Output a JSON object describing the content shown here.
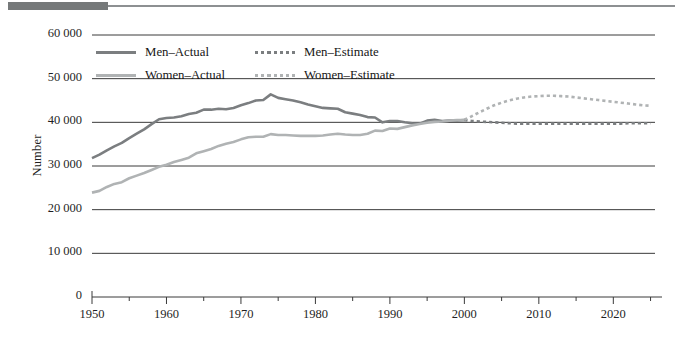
{
  "figure": {
    "y_axis_title": "Number",
    "rule_color": "#76797a"
  },
  "legend": {
    "entries": [
      {
        "label": "Men–Actual",
        "series": "men_actual",
        "style": "solid",
        "color": "#7b7e80"
      },
      {
        "label": "Men–Estimate",
        "series": "men_estimate",
        "style": "dotted",
        "color": "#7b7e80"
      },
      {
        "label": "Women–Actual",
        "series": "women_actual",
        "style": "solid",
        "color": "#b0b3b4"
      },
      {
        "label": "Women–Estimate",
        "series": "women_estimate",
        "style": "dotted",
        "color": "#b0b3b4"
      }
    ]
  },
  "chart_data": {
    "type": "line",
    "title": "",
    "xlabel": "",
    "ylabel": "Number",
    "xlim": [
      1950,
      2026
    ],
    "ylim": [
      0,
      60000
    ],
    "grid": "horizontal",
    "legend_position": "top-left-inside",
    "ytick_labels": [
      "0",
      "10 000",
      "20 000",
      "30 000",
      "40 000",
      "50 000",
      "60 000"
    ],
    "ytick_values": [
      0,
      10000,
      20000,
      30000,
      40000,
      50000,
      60000
    ],
    "xtick_labels": [
      "1950",
      "1960",
      "1970",
      "1980",
      "1990",
      "2000",
      "2010",
      "2020"
    ],
    "xtick_values": [
      1950,
      1960,
      1970,
      1980,
      1990,
      2000,
      2010,
      2020
    ],
    "xtick_minor_values": [
      1955,
      1965,
      1975,
      1985,
      1995,
      2005,
      2015,
      2025
    ],
    "series": [
      {
        "name": "Men–Actual",
        "key": "men_actual",
        "style": "solid",
        "color": "#7b7e80",
        "x": [
          1950,
          1951,
          1952,
          1953,
          1954,
          1955,
          1956,
          1957,
          1958,
          1959,
          1960,
          1961,
          1962,
          1963,
          1964,
          1965,
          1966,
          1967,
          1968,
          1969,
          1970,
          1971,
          1972,
          1973,
          1974,
          1975,
          1976,
          1977,
          1978,
          1979,
          1980,
          1981,
          1982,
          1983,
          1984,
          1985,
          1986,
          1987,
          1988,
          1989,
          1990,
          1991,
          1992,
          1993,
          1994,
          1995,
          1996,
          1997,
          1998,
          1999,
          2000
        ],
        "values": [
          31800,
          32600,
          33600,
          34500,
          35300,
          36400,
          37400,
          38400,
          39600,
          40700,
          41000,
          41100,
          41400,
          41900,
          42200,
          42900,
          42900,
          43100,
          43000,
          43300,
          43900,
          44400,
          45000,
          45100,
          46400,
          45600,
          45300,
          45000,
          44600,
          44100,
          43700,
          43300,
          43200,
          43100,
          42300,
          42000,
          41700,
          41200,
          41100,
          40000,
          40300,
          40300,
          40000,
          39800,
          39700,
          40400,
          40600,
          40300,
          40400,
          40400,
          40500
        ]
      },
      {
        "name": "Women–Actual",
        "key": "women_actual",
        "style": "solid",
        "color": "#b0b3b4",
        "x": [
          1950,
          1951,
          1952,
          1953,
          1954,
          1955,
          1956,
          1957,
          1958,
          1959,
          1960,
          1961,
          1962,
          1963,
          1964,
          1965,
          1966,
          1967,
          1968,
          1969,
          1970,
          1971,
          1972,
          1973,
          1974,
          1975,
          1976,
          1977,
          1978,
          1979,
          1980,
          1981,
          1982,
          1983,
          1984,
          1985,
          1986,
          1987,
          1988,
          1989,
          1990,
          1991,
          1992,
          1993,
          1994,
          1995,
          1996,
          1997,
          1998,
          1999,
          2000
        ],
        "values": [
          23900,
          24300,
          25200,
          25900,
          26300,
          27200,
          27800,
          28400,
          29100,
          29800,
          30300,
          30900,
          31400,
          31900,
          32900,
          33400,
          33900,
          34600,
          35100,
          35500,
          36100,
          36600,
          36700,
          36700,
          37300,
          37100,
          37100,
          37000,
          36900,
          36900,
          36900,
          37000,
          37200,
          37400,
          37200,
          37100,
          37100,
          37400,
          38100,
          38000,
          38600,
          38500,
          38900,
          39300,
          39600,
          39900,
          40100,
          40200,
          40400,
          40500,
          40500
        ]
      },
      {
        "name": "Men–Estimate",
        "key": "men_estimate",
        "style": "dotted",
        "color": "#7b7e80",
        "x": [
          2000,
          2001,
          2002,
          2003,
          2004,
          2005,
          2006,
          2007,
          2008,
          2009,
          2010,
          2011,
          2012,
          2013,
          2014,
          2015,
          2016,
          2017,
          2018,
          2019,
          2020,
          2021,
          2022,
          2023,
          2024,
          2025
        ],
        "values": [
          40500,
          40300,
          40200,
          40100,
          40000,
          39900,
          39800,
          39700,
          39700,
          39700,
          39700,
          39700,
          39700,
          39700,
          39700,
          39700,
          39700,
          39700,
          39700,
          39700,
          39700,
          39700,
          39800,
          39800,
          39800,
          39800
        ]
      },
      {
        "name": "Women–Estimate",
        "key": "women_estimate",
        "style": "dotted",
        "color": "#b0b3b4",
        "x": [
          2000,
          2001,
          2002,
          2003,
          2004,
          2005,
          2006,
          2007,
          2008,
          2009,
          2010,
          2011,
          2012,
          2013,
          2014,
          2015,
          2016,
          2017,
          2018,
          2019,
          2020,
          2021,
          2022,
          2023,
          2024,
          2025
        ],
        "values": [
          40600,
          41400,
          42300,
          43100,
          43900,
          44500,
          45000,
          45400,
          45700,
          45900,
          46000,
          46100,
          46100,
          46000,
          45900,
          45700,
          45500,
          45300,
          45100,
          44900,
          44700,
          44500,
          44300,
          44100,
          43900,
          43800
        ]
      }
    ]
  }
}
